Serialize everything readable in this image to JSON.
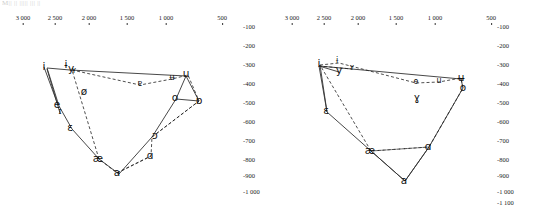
{
  "page": {
    "bleed_text": "M|| ||   |||||   |||  ||",
    "background": "#ffffff",
    "line_solid_color": "#333333",
    "line_dashed_color": "#222222"
  },
  "charts": [
    {
      "id": "left-chart",
      "name": "vowel-chart-left",
      "x_axis": {
        "label": "F2 (Hz)",
        "reversed": true,
        "ticks": [
          "3 000",
          "2 500",
          "2 000",
          "1 500",
          "1 000",
          "500"
        ],
        "tick_values": [
          3000,
          2500,
          2000,
          1500,
          1000,
          500
        ],
        "tick_x_px": [
          23,
          55,
          89,
          127,
          166,
          222
        ]
      },
      "y_axis": {
        "label": "F1 (Hz)",
        "ticks": [
          "-100",
          "-200",
          "-300",
          "-400",
          "-500",
          "-600",
          "-700",
          "-800",
          "-900",
          "-1 000"
        ],
        "tick_values": [
          -100,
          -200,
          -300,
          -400,
          -500,
          -600,
          -700,
          -800,
          -900,
          -1000
        ],
        "tick_y_px": [
          23,
          42,
          61,
          80,
          99,
          118,
          137,
          156,
          172,
          188
        ]
      },
      "vowels": [
        {
          "symbol": "i",
          "x": 44,
          "y": 66,
          "size": "big"
        },
        {
          "symbol": "ɨ",
          "x": 66,
          "y": 64,
          "size": "big"
        },
        {
          "symbol": "y",
          "x": 71,
          "y": 68,
          "size": "big"
        },
        {
          "symbol": "ʏ",
          "x": 74,
          "y": 71,
          "size": "sm"
        },
        {
          "symbol": "ø",
          "x": 84,
          "y": 91,
          "size": "big"
        },
        {
          "symbol": "e",
          "x": 57,
          "y": 104,
          "size": "big"
        },
        {
          "symbol": "ɪ",
          "x": 60,
          "y": 112,
          "size": "sm"
        },
        {
          "symbol": "ɛ",
          "x": 70,
          "y": 127,
          "size": "big"
        },
        {
          "symbol": "æ",
          "x": 98,
          "y": 158,
          "size": "big"
        },
        {
          "symbol": "a",
          "x": 117,
          "y": 172,
          "size": "big"
        },
        {
          "symbol": "ɑ",
          "x": 150,
          "y": 155,
          "size": "big"
        },
        {
          "symbol": "ɔ",
          "x": 155,
          "y": 135,
          "size": "big"
        },
        {
          "symbol": "o",
          "x": 175,
          "y": 97,
          "size": "big"
        },
        {
          "symbol": "ʉ",
          "x": 172,
          "y": 78,
          "size": "sm"
        },
        {
          "symbol": "u",
          "x": 186,
          "y": 73,
          "size": "big"
        },
        {
          "symbol": "ɒ",
          "x": 199,
          "y": 100,
          "size": "big"
        },
        {
          "symbol": "ɐ",
          "x": 140,
          "y": 84,
          "size": "sm"
        }
      ],
      "solid_polygon": [
        [
          47,
          68
        ],
        [
          70,
          70
        ],
        [
          186,
          76
        ],
        [
          176,
          99
        ],
        [
          152,
          137
        ],
        [
          119,
          174
        ],
        [
          99,
          159
        ],
        [
          72,
          129
        ],
        [
          59,
          106
        ],
        [
          47,
          68
        ]
      ],
      "dashed_polygon": [
        [
          72,
          70
        ],
        [
          140,
          85
        ],
        [
          172,
          79
        ],
        [
          188,
          75
        ],
        [
          199,
          101
        ],
        [
          152,
          137
        ],
        [
          151,
          156
        ],
        [
          117,
          173
        ],
        [
          99,
          159
        ],
        [
          72,
          70
        ]
      ],
      "extra_solid": [
        [
          [
            44,
            67
          ],
          [
            58,
            105
          ]
        ],
        [
          [
            47,
            69
          ],
          [
            60,
            113
          ]
        ],
        [
          [
            176,
            99
          ],
          [
            199,
            101
          ]
        ],
        [
          [
            186,
            76
          ],
          [
            199,
            101
          ]
        ]
      ],
      "extra_dashed": [
        [
          [
            152,
            137
          ],
          [
            199,
            101
          ]
        ],
        [
          [
            117,
            173
          ],
          [
            151,
            156
          ]
        ]
      ]
    },
    {
      "id": "right-chart",
      "name": "vowel-chart-right",
      "x_axis": {
        "label": "F2 (Hz)",
        "reversed": true,
        "ticks": [
          "3 000",
          "2 500",
          "2 000",
          "1 500",
          "1 000",
          "500"
        ],
        "tick_values": [
          3000,
          2500,
          2000,
          1500,
          1000,
          500
        ],
        "tick_x_px": [
          23,
          55,
          89,
          127,
          166,
          222
        ]
      },
      "y_axis": {
        "label": "F1 (Hz)",
        "ticks": [
          "-100",
          "-200",
          "-300",
          "-400",
          "-500",
          "-600",
          "-700",
          "-800",
          "-900",
          "-1 000",
          "-1 100"
        ],
        "tick_values": [
          -100,
          -200,
          -300,
          -400,
          -500,
          -600,
          -700,
          -800,
          -900,
          -1000,
          -1100
        ],
        "tick_y_px": [
          23,
          42,
          61,
          80,
          99,
          118,
          137,
          156,
          172,
          188,
          199
        ]
      },
      "vowels": [
        {
          "symbol": "i",
          "x": 50,
          "y": 63,
          "size": "big"
        },
        {
          "symbol": "ɨ",
          "x": 68,
          "y": 61,
          "size": "sm"
        },
        {
          "symbol": "y",
          "x": 70,
          "y": 70,
          "size": "big"
        },
        {
          "symbol": "ʏ",
          "x": 83,
          "y": 68,
          "size": "sm"
        },
        {
          "symbol": "ɛ",
          "x": 57,
          "y": 110,
          "size": "big"
        },
        {
          "symbol": "æ",
          "x": 101,
          "y": 150,
          "size": "big"
        },
        {
          "symbol": "a",
          "x": 135,
          "y": 180,
          "size": "big"
        },
        {
          "symbol": "ɑ",
          "x": 159,
          "y": 146,
          "size": "big"
        },
        {
          "symbol": "o",
          "x": 194,
          "y": 87,
          "size": "big"
        },
        {
          "symbol": "ɵ",
          "x": 147,
          "y": 82,
          "size": "sm"
        },
        {
          "symbol": "u",
          "x": 170,
          "y": 81,
          "size": "sm"
        },
        {
          "symbol": "ʉ",
          "x": 192,
          "y": 77,
          "size": "big"
        },
        {
          "symbol": "ɣ",
          "x": 148,
          "y": 97,
          "size": "big"
        }
      ],
      "solid_polygon": [
        [
          50,
          66
        ],
        [
          192,
          79
        ],
        [
          194,
          88
        ],
        [
          160,
          147
        ],
        [
          136,
          181
        ],
        [
          102,
          151
        ],
        [
          58,
          112
        ],
        [
          50,
          66
        ]
      ],
      "dashed_polygon": [
        [
          51,
          65
        ],
        [
          70,
          63
        ],
        [
          147,
          83
        ],
        [
          170,
          82
        ],
        [
          192,
          78
        ],
        [
          194,
          88
        ],
        [
          160,
          147
        ],
        [
          102,
          151
        ],
        [
          51,
          65
        ]
      ],
      "extra_solid": [
        [
          [
            50,
            66
          ],
          [
            70,
            72
          ]
        ],
        [
          [
            51,
            65
          ],
          [
            58,
            112
          ]
        ],
        [
          [
            136,
            181
          ],
          [
            160,
            147
          ]
        ],
        [
          [
            102,
            151
          ],
          [
            136,
            181
          ]
        ]
      ],
      "extra_dashed": [
        [
          [
            102,
            151
          ],
          [
            160,
            147
          ]
        ],
        [
          [
            50,
            66
          ],
          [
            83,
            69
          ]
        ]
      ]
    }
  ]
}
